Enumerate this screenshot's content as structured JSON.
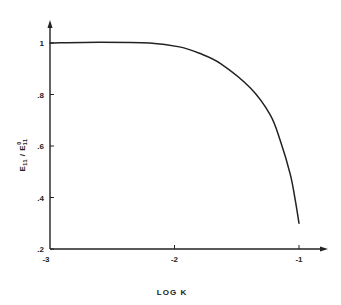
{
  "chart_data": {
    "type": "line",
    "title": "",
    "xlabel": "LOG K",
    "ylabel": "E11 / E0 11",
    "ylabel_parts": {
      "main": "E",
      "sub": "11",
      "sep": " / ",
      "main2": "E",
      "sup2": "0",
      "sub2": "11"
    },
    "xlim": [
      -3,
      -0.8
    ],
    "ylim": [
      0.2,
      1.05
    ],
    "x_ticks": [
      -3,
      -2,
      -1
    ],
    "x_tick_labels": [
      "-3",
      "-2",
      "-1"
    ],
    "y_ticks": [
      0.2,
      0.4,
      0.6,
      0.8,
      1.0
    ],
    "y_tick_labels": [
      ".2",
      ".4",
      ".6",
      ".8",
      "1"
    ],
    "grid": false,
    "legend": null,
    "series": [
      {
        "name": "E11/E0 11",
        "x": [
          -3.0,
          -2.6,
          -2.2,
          -1.96,
          -1.8,
          -1.63,
          -1.39,
          -1.23,
          -1.15,
          -1.07,
          -1.03,
          -1.0
        ],
        "y": [
          1.0,
          1.003,
          1.0,
          0.985,
          0.96,
          0.92,
          0.825,
          0.72,
          0.62,
          0.49,
          0.39,
          0.3
        ]
      }
    ]
  }
}
